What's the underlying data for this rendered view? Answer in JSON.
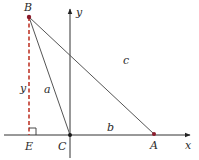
{
  "diagram": {
    "type": "triangle-on-coordinate-axes",
    "colors": {
      "line": "#555555",
      "axis": "#333333",
      "dashed": "#c0392b",
      "point": "#8b1a2b"
    },
    "points": {
      "B": {
        "label": "B",
        "x": 29,
        "y": 17
      },
      "C": {
        "label": "C",
        "x": 70,
        "y": 135
      },
      "A": {
        "label": "A",
        "x": 154,
        "y": 134
      },
      "E": {
        "label": "E",
        "x": 29,
        "y": 135
      }
    },
    "axes": {
      "x_label": "x",
      "y_label": "y"
    },
    "sides": {
      "a": "a",
      "b": "b",
      "c": "c",
      "height": "y"
    }
  }
}
